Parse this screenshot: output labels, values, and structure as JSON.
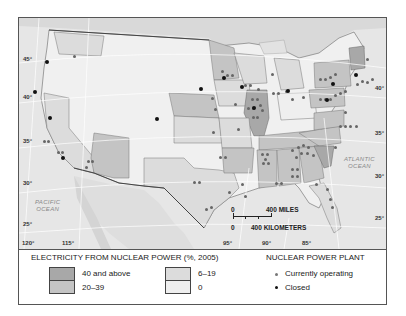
{
  "map": {
    "subject": "United States nuclear power",
    "latitude_labels": [
      "45°",
      "40°",
      "35°",
      "30°",
      "25°"
    ],
    "latitude_labels_right": [
      "40°",
      "35°",
      "30°",
      "25°"
    ],
    "longitude_labels": [
      "120°",
      "115°",
      "95°",
      "90°",
      "85°"
    ],
    "oceans": {
      "pacific": "PACIFIC\nOCEAN",
      "atlantic": "ATLANTIC\nOCEAN"
    },
    "scale": {
      "miles_zero": "0",
      "miles_label": "400 MILES",
      "km_zero": "0",
      "km_label": "400 KILOMETERS"
    }
  },
  "legend": {
    "choropleth_title": "ELECTRICITY FROM NUCLEAR POWER (%, 2005)",
    "classes": [
      {
        "label": "40 and above",
        "color": "#a8a8a8"
      },
      {
        "label": "20–39",
        "color": "#c4c4c4"
      },
      {
        "label": "6–19",
        "color": "#dcdcdc"
      },
      {
        "label": "0",
        "color": "#efefef"
      }
    ],
    "plant_title": "NUCLEAR POWER PLANT",
    "plants": [
      {
        "label": "Currently operating",
        "color": "#666666"
      },
      {
        "label": "Closed",
        "color": "#111111"
      }
    ]
  }
}
